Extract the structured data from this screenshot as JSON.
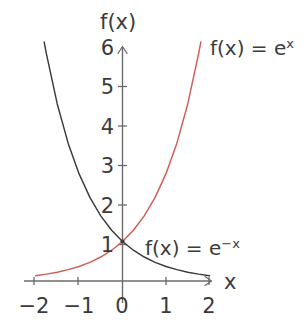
{
  "figure": {
    "axis_titles": {
      "y": "f(x)",
      "x": "x"
    },
    "y_ticks": [
      "6",
      "5",
      "4",
      "3",
      "2",
      "1"
    ],
    "x_ticks": [
      "−2",
      "−1",
      "0",
      "1",
      "2"
    ],
    "labels": {
      "exp": {
        "lhs": "f(x) = e",
        "sup": "x"
      },
      "negexp": {
        "lhs": "f(x) = e",
        "sup": "−x"
      }
    },
    "colors": {
      "exp_curve": "#cf5c55",
      "negexp_curve": "#3b3b3b",
      "axis": "#6b6b6b",
      "text": "#3b3b3b",
      "background": "#ffffff"
    }
  },
  "chart_data": {
    "type": "line",
    "title": "",
    "xlabel": "x",
    "ylabel": "f(x)",
    "xlim": [
      -2.3,
      2.1
    ],
    "ylim": [
      0,
      6.2
    ],
    "xticks": [
      -2,
      -1,
      0,
      1,
      2
    ],
    "yticks": [
      1,
      2,
      3,
      4,
      5,
      6
    ],
    "grid": false,
    "legend": "inline-annotations",
    "series": [
      {
        "name": "f(x) = e^x",
        "color": "#cf5c55",
        "x": [
          -2.0,
          -1.75,
          -1.5,
          -1.25,
          -1.0,
          -0.75,
          -0.5,
          -0.25,
          0.0,
          0.25,
          0.5,
          0.75,
          1.0,
          1.25,
          1.5,
          1.75,
          1.8
        ],
        "y": [
          0.135,
          0.174,
          0.223,
          0.287,
          0.368,
          0.472,
          0.607,
          0.779,
          1.0,
          1.284,
          1.649,
          2.117,
          2.718,
          3.49,
          4.482,
          5.755,
          6.05
        ]
      },
      {
        "name": "f(x) = e^-x",
        "color": "#3b3b3b",
        "x": [
          -1.8,
          -1.75,
          -1.5,
          -1.25,
          -1.0,
          -0.75,
          -0.5,
          -0.25,
          0.0,
          0.25,
          0.5,
          0.75,
          1.0,
          1.25,
          1.5,
          1.75,
          2.0
        ],
        "y": [
          6.05,
          5.755,
          4.482,
          3.49,
          2.718,
          2.117,
          1.649,
          1.284,
          1.0,
          0.779,
          0.607,
          0.472,
          0.368,
          0.287,
          0.223,
          0.174,
          0.135
        ]
      }
    ],
    "intersection": {
      "x": 0,
      "y": 1
    }
  }
}
